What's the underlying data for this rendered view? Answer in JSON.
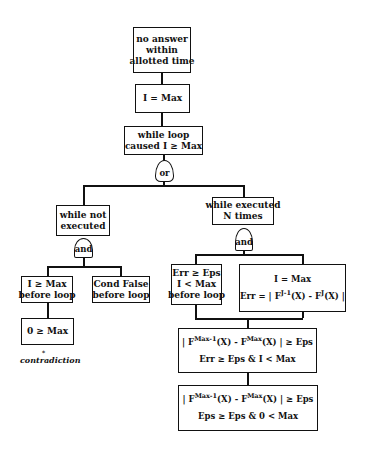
{
  "diagram": {
    "type": "fault-tree",
    "nodes": {
      "root": {
        "lines": [
          "no answer",
          "within",
          "allotted time"
        ]
      },
      "i_eq_max": {
        "lines": [
          "I = Max"
        ]
      },
      "while_caused": {
        "lines": [
          "while loop",
          "caused I ≥ Max"
        ]
      },
      "or_gate": {
        "label": "or"
      },
      "while_not_executed": {
        "lines": [
          "while not",
          "executed"
        ]
      },
      "and_gate_left": {
        "label": "and"
      },
      "i_ge_max_before": {
        "lines": [
          "I ≥ Max",
          "before loop"
        ]
      },
      "cond_false": {
        "lines": [
          "Cond False",
          "before loop"
        ]
      },
      "zero_ge_max": {
        "lines": [
          "0 ≥ Max"
        ]
      },
      "contradiction_note": {
        "label": "contradiction",
        "marker": "*"
      },
      "while_executed_n": {
        "lines": [
          "while executed",
          "N times"
        ]
      },
      "and_gate_right": {
        "label": "and"
      },
      "err_ge_eps_before": {
        "lines": [
          "Err ≥ Eps",
          "I < Max",
          "before loop"
        ]
      },
      "i_max_err": {
        "line1": "I = Max",
        "line2": {
          "prefix": "Err = | F",
          "sup1": "J-1",
          "mid": "(X) - F",
          "sup2": "J",
          "suffix": "(X) |"
        }
      },
      "fmax_box1": {
        "line1": {
          "prefix": "| F",
          "sup1": "Max-1",
          "mid": "(X) - F",
          "sup2": "Max",
          "suffix": "(X) | ≥ Eps"
        },
        "line2": "Err ≥ Eps & I < Max"
      },
      "fmax_box2": {
        "line1": {
          "prefix": "| F",
          "sup1": "Max-1",
          "mid": "(X) - F",
          "sup2": "Max",
          "suffix": "(X) | ≥ Eps"
        },
        "line2": "Eps ≥ Eps & 0 < Max"
      }
    }
  }
}
